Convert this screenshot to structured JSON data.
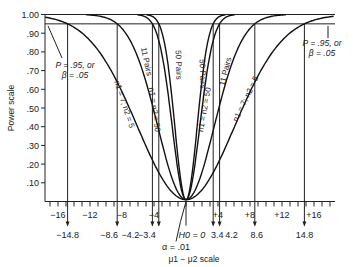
{
  "chart_data": {
    "type": "line",
    "title": "",
    "xlabel": "μ1 − μ2 scale",
    "ylabel": "Power scale",
    "ylim": [
      0,
      1.0
    ],
    "xlim": [
      -18,
      18
    ],
    "y_ticks": [
      "1.00",
      ".90",
      ".80",
      ".70",
      ".60",
      ".50",
      ".40",
      ".30",
      ".20",
      ".10"
    ],
    "y_tick_values": [
      1.0,
      0.9,
      0.8,
      0.7,
      0.6,
      0.5,
      0.4,
      0.3,
      0.2,
      0.1
    ],
    "x_ticks": [
      "−16",
      "−12",
      "−8",
      "−4",
      "+4",
      "+8",
      "+12",
      "+16"
    ],
    "x_tick_values": [
      -16,
      -12,
      -8,
      -4,
      4,
      8,
      12,
      16
    ],
    "x_markers": [
      {
        "label": "−14.8",
        "value": -14.8
      },
      {
        "label": "−8.6",
        "value": -8.6
      },
      {
        "label": "−4.2",
        "value": -4.2
      },
      {
        "label": "−3.4",
        "value": -3.4
      },
      {
        "label": "3.4",
        "value": 3.4
      },
      {
        "label": "4.2",
        "value": 4.2
      },
      {
        "label": "8.6",
        "value": 8.6
      },
      {
        "label": "14.8",
        "value": 14.8
      }
    ],
    "h0_label": "H0 = 0",
    "alpha_label": "α = .01",
    "power_line": 0.95,
    "annotations": {
      "left": [
        "P = .95, or",
        "β = .05"
      ],
      "right": [
        "P = .95, or",
        "β = .05"
      ]
    },
    "series": [
      {
        "name": "n1 = 7; n2 = 5",
        "reaches_095_at": 14.8,
        "side": "both"
      },
      {
        "name": "11 Pairs",
        "reaches_095_at": 8.6,
        "side": "both"
      },
      {
        "name": "n1 = n2 = 50",
        "reaches_095_at": 4.2,
        "side": "both"
      },
      {
        "name": "50 Pairs",
        "reaches_095_at": 3.4,
        "side": "both"
      }
    ],
    "curve_labels": {
      "left_n7": "n1 = 7; n2 = 5",
      "left_11": "11 Pairs",
      "left_n50": "n1 = n2 = 50",
      "left_50p": "50 Pairs",
      "right_50p": "50 Pairs",
      "right_n50": "n1 = n2 = 50",
      "right_11": "11 Pairs",
      "right_n7": "n1 = 7; n2 = 5"
    },
    "grid": false,
    "legend": "none"
  }
}
